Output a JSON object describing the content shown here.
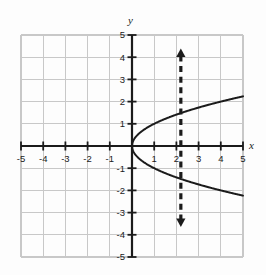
{
  "figure": {
    "name": "coordinate-plane-graph",
    "background_color": "#fdfdfd",
    "grid_color": "#c8c8c8",
    "axis_color": "#1b1b1b",
    "curve_color": "#1b1b1b",
    "dashed_line_color": "#1b1b1b"
  },
  "axes": {
    "x_label": "x",
    "y_label": "y",
    "x_ticks": [
      "-5",
      "-4",
      "-3",
      "-2",
      "-1",
      "1",
      "2",
      "3",
      "4",
      "5"
    ],
    "y_ticks": [
      "5",
      "4",
      "3",
      "2",
      "1",
      "-1",
      "-2",
      "-3",
      "-4",
      "-5"
    ]
  },
  "chart_data": {
    "type": "line",
    "title": "",
    "xlabel": "x",
    "ylabel": "y",
    "xlim": [
      -5,
      5
    ],
    "ylim": [
      -5,
      5
    ],
    "grid": true,
    "legend": "none",
    "x_ticks": [
      -5,
      -4,
      -3,
      -2,
      -1,
      1,
      2,
      3,
      4,
      5
    ],
    "y_ticks": [
      5,
      4,
      3,
      2,
      1,
      -1,
      -2,
      -3,
      -4,
      -5
    ],
    "series": [
      {
        "name": "sideways-parabola-upper-branch",
        "equation": "y = sqrt(x)",
        "style": "solid",
        "x": [
          0,
          0.25,
          0.5,
          1,
          1.5,
          2,
          2.2,
          2.5,
          3,
          3.5,
          4,
          4.5,
          5
        ],
        "values": [
          0,
          0.5,
          0.71,
          1,
          1.22,
          1.41,
          1.48,
          1.58,
          1.73,
          1.87,
          2,
          2.12,
          2.24
        ]
      },
      {
        "name": "sideways-parabola-lower-branch",
        "equation": "y = -sqrt(x)",
        "style": "solid",
        "x": [
          0,
          0.25,
          0.5,
          1,
          1.5,
          2,
          2.2,
          2.5,
          3,
          3.5,
          4,
          4.5,
          5
        ],
        "values": [
          0,
          -0.5,
          -0.71,
          -1,
          -1.22,
          -1.41,
          -1.48,
          -1.58,
          -1.73,
          -1.87,
          -2,
          -2.12,
          -2.24
        ]
      },
      {
        "name": "vertical-test-line",
        "equation": "x = 2.2",
        "style": "dashed",
        "arrows": "both",
        "x": [
          2.2,
          2.2
        ],
        "values": [
          -3.6,
          4.35
        ]
      }
    ],
    "annotations": [
      {
        "name": "intersection-upper",
        "x": 2.2,
        "y": 1.48
      },
      {
        "name": "intersection-lower",
        "x": 2.2,
        "y": -1.48
      }
    ]
  }
}
